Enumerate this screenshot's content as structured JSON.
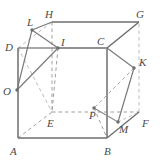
{
  "figure": {
    "width": 161,
    "height": 160,
    "background_color": "#ffffff",
    "solid_edge_color": "#6e6e6e",
    "hidden_edge_color": "#b4b4b4",
    "construction_line_color": "#8a8a8a",
    "label_color": "#4a4a4a",
    "point_color": "#6e6e6e"
  },
  "labels": {
    "A": "A",
    "B": "B",
    "C": "C",
    "D": "D",
    "E": "E",
    "F": "F",
    "G": "G",
    "H": "H",
    "I": "I",
    "K": "K",
    "L": "L",
    "M": "M",
    "O": "O",
    "P": "P"
  },
  "geometry": {
    "vertices": {
      "A": [
        18,
        138
      ],
      "B": [
        107,
        138
      ],
      "C": [
        107,
        48
      ],
      "D": [
        18,
        48
      ],
      "E": [
        52,
        112
      ],
      "F": [
        139,
        112
      ],
      "G": [
        139,
        22
      ],
      "H": [
        52,
        22
      ],
      "I": [
        58,
        48
      ],
      "K": [
        134,
        68
      ],
      "L": [
        32,
        30
      ],
      "M": [
        118,
        122
      ],
      "O": [
        17,
        90
      ],
      "P": [
        94,
        108
      ]
    },
    "label_positions": {
      "A": [
        10,
        152
      ],
      "B": [
        104,
        152
      ],
      "C": [
        99,
        44
      ],
      "D": [
        6,
        50
      ],
      "E": [
        48,
        126
      ],
      "F": [
        142,
        125
      ],
      "G": [
        139,
        18
      ],
      "H": [
        47,
        17
      ],
      "I": [
        62,
        44
      ],
      "K": [
        141,
        63
      ],
      "L": [
        28,
        25
      ],
      "M": [
        121,
        132
      ],
      "O": [
        5,
        95
      ],
      "P": [
        92,
        120
      ]
    }
  }
}
